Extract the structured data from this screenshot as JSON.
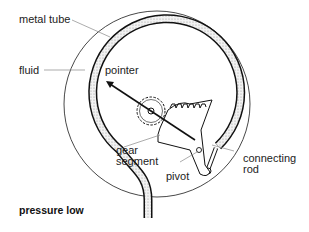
{
  "diagram": {
    "title": "pressure low",
    "labels": {
      "metal_tube": "metal tube",
      "fluid": "fluid",
      "pointer": "pointer",
      "gear_segment_line1": "gear",
      "gear_segment_line2": "segment",
      "pivot": "pivot",
      "connecting_rod_line1": "connecting",
      "connecting_rod_line2": "rod"
    },
    "colors": {
      "line": "#111111",
      "leader": "#888888",
      "fluid_fill": "#d8d8d8"
    }
  }
}
